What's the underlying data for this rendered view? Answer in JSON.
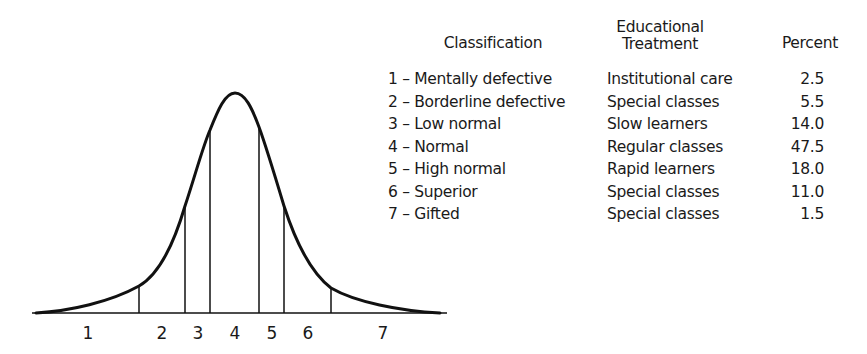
{
  "chart_data": {
    "type": "area",
    "title": "",
    "xlabel": "",
    "ylabel": "",
    "grid": false,
    "legend_position": "right (table)",
    "regions": [
      "1",
      "2",
      "3",
      "4",
      "5",
      "6",
      "7"
    ],
    "table": {
      "headers": {
        "classification": "Classification",
        "treatment_line1": "Educational",
        "treatment_line2": "Treatment",
        "percent": "Percent"
      },
      "rows": [
        {
          "num": "1",
          "classification": "1 – Mentally defective",
          "treatment": "Institutional care",
          "percent": "2.5"
        },
        {
          "num": "2",
          "classification": "2 – Borderline defective",
          "treatment": "Special classes",
          "percent": "5.5"
        },
        {
          "num": "3",
          "classification": "3 – Low normal",
          "treatment": "Slow learners",
          "percent": "14.0"
        },
        {
          "num": "4",
          "classification": "4 – Normal",
          "treatment": "Regular classes",
          "percent": "47.5"
        },
        {
          "num": "5",
          "classification": "5 – High normal",
          "treatment": "Rapid learners",
          "percent": "18.0"
        },
        {
          "num": "6",
          "classification": "6 – Superior",
          "treatment": "Special classes",
          "percent": "11.0"
        },
        {
          "num": "7",
          "classification": "7 – Gifted",
          "treatment": "Special classes",
          "percent": "1.5"
        }
      ]
    },
    "categories": [
      "Mentally defective",
      "Borderline defective",
      "Low normal",
      "Normal",
      "High normal",
      "Superior",
      "Gifted"
    ],
    "values": [
      2.5,
      5.5,
      14.0,
      47.5,
      18.0,
      11.0,
      1.5
    ],
    "units": "percent"
  },
  "curve": {
    "stroke": "#111111",
    "baseline": {
      "x1": 32,
      "x2": 447,
      "y": 313
    },
    "dividers": [
      {
        "x": 139,
        "top": 286
      },
      {
        "x": 185,
        "top": 206
      },
      {
        "x": 210,
        "top": 130
      },
      {
        "x": 259,
        "top": 127
      },
      {
        "x": 284,
        "top": 206
      },
      {
        "x": 331,
        "top": 288
      }
    ],
    "region_labels": [
      {
        "text": "1",
        "x": 88
      },
      {
        "text": "2",
        "x": 162
      },
      {
        "text": "3",
        "x": 198
      },
      {
        "text": "4",
        "x": 235
      },
      {
        "text": "5",
        "x": 272
      },
      {
        "text": "6",
        "x": 308
      },
      {
        "text": "7",
        "x": 383
      }
    ]
  }
}
